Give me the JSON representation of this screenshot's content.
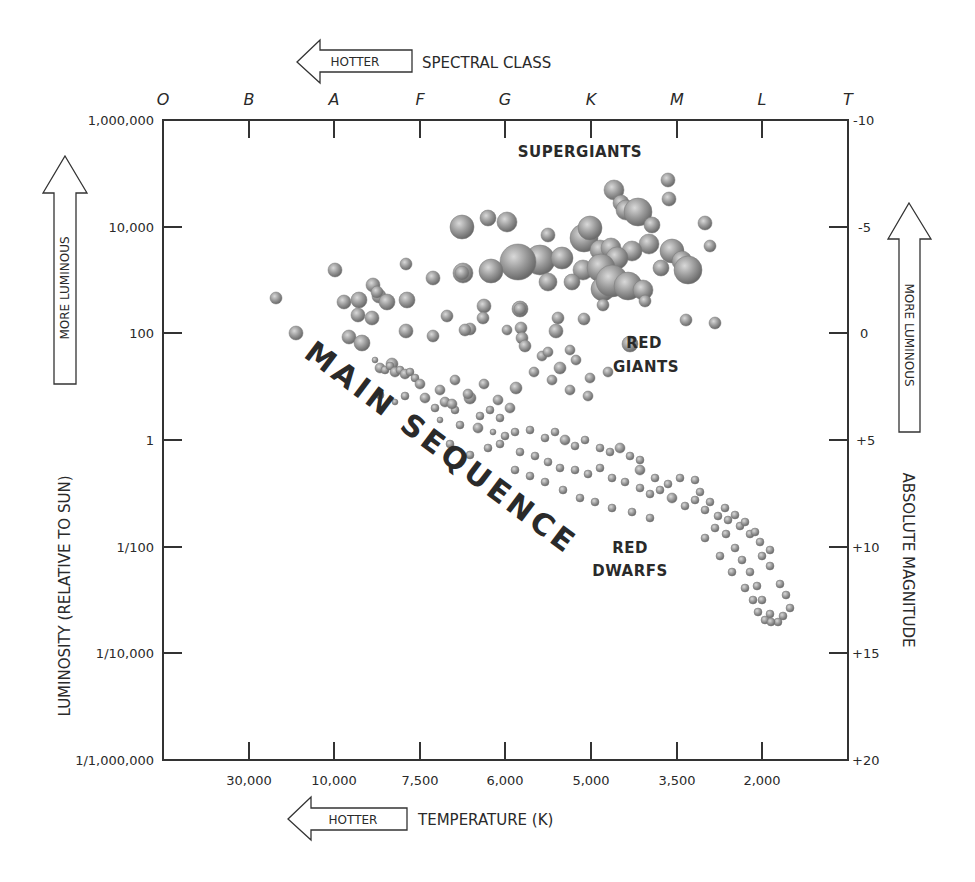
{
  "chart_data": {
    "type": "scatter",
    "top_axis": {
      "label": "SPECTRAL CLASS",
      "arrow_label": "HOTTER",
      "ticks": [
        "O",
        "B",
        "A",
        "F",
        "G",
        "K",
        "M",
        "L",
        "T"
      ]
    },
    "bottom_axis": {
      "label": "TEMPERATURE (K)",
      "arrow_label": "HOTTER",
      "ticks": [
        "30,000",
        "10,000",
        "7,500",
        "6,000",
        "5,000",
        "3,500",
        "2,000"
      ]
    },
    "left_axis": {
      "label": "LUMINOSITY (RELATIVE TO SUN)",
      "arrow_label": "MORE LUMINOUS",
      "scale": "log",
      "ticks": [
        "1,000,000",
        "10,000",
        "100",
        "1",
        "1/100",
        "1/10,000",
        "1/1,000,000"
      ],
      "ylim": [
        1e-06,
        1000000
      ]
    },
    "right_axis": {
      "label": "ABSOLUTE MAGNITUDE",
      "arrow_label": "MORE LUMINOUS",
      "ticks": [
        "-10",
        "-5",
        "0",
        "+5",
        "+10",
        "+15",
        "+20"
      ],
      "ylim": [
        -10,
        20
      ]
    },
    "annotations": [
      "SUPERGIANTS",
      "RED GIANTS",
      "MAIN SEQUENCE",
      "RED DWARFS"
    ],
    "grid": false,
    "legend": null,
    "series": [
      {
        "name": "Supergiants",
        "points_px": [
          [
            462,
            227,
            12
          ],
          [
            488,
            218,
            8
          ],
          [
            507,
            222,
            10
          ],
          [
            540,
            260,
            15
          ],
          [
            518,
            262,
            18
          ],
          [
            562,
            258,
            11
          ],
          [
            584,
            238,
            14
          ],
          [
            590,
            228,
            12
          ],
          [
            600,
            250,
            10
          ],
          [
            614,
            190,
            10
          ],
          [
            621,
            203,
            8
          ],
          [
            626,
            210,
            10
          ],
          [
            638,
            212,
            14
          ],
          [
            652,
            225,
            8
          ],
          [
            649,
            244,
            10
          ],
          [
            632,
            251,
            10
          ],
          [
            611,
            248,
            10
          ],
          [
            583,
            270,
            10
          ],
          [
            572,
            282,
            8
          ],
          [
            617,
            258,
            11
          ],
          [
            601,
            268,
            14
          ],
          [
            603,
            289,
            12
          ],
          [
            612,
            281,
            16
          ],
          [
            628,
            286,
            14
          ],
          [
            643,
            290,
            10
          ],
          [
            672,
            251,
            12
          ],
          [
            682,
            261,
            10
          ],
          [
            661,
            268,
            8
          ],
          [
            688,
            270,
            14
          ],
          [
            669,
            199,
            7
          ],
          [
            705,
            223,
            7
          ],
          [
            710,
            246,
            6
          ],
          [
            463,
            273,
            10
          ],
          [
            491,
            271,
            12
          ],
          [
            630,
            344,
            8
          ],
          [
            668,
            180,
            7
          ],
          [
            548,
            235,
            7
          ],
          [
            548,
            282,
            9
          ],
          [
            484,
            306,
            7
          ],
          [
            520,
            309,
            8
          ]
        ]
      },
      {
        "name": "Giants / bright stars",
        "points_px": [
          [
            276,
            298,
            6
          ],
          [
            296,
            333,
            7
          ],
          [
            344,
            302,
            7
          ],
          [
            373,
            285,
            7
          ],
          [
            379,
            296,
            7
          ],
          [
            359,
            300,
            8
          ],
          [
            358,
            315,
            7
          ],
          [
            349,
            337,
            7
          ],
          [
            372,
            318,
            7
          ],
          [
            377,
            292,
            6
          ],
          [
            387,
            302,
            8
          ],
          [
            407,
            300,
            8
          ],
          [
            406,
            331,
            7
          ],
          [
            362,
            343,
            8
          ],
          [
            392,
            364,
            6
          ],
          [
            335,
            270,
            7
          ],
          [
            406,
            264,
            6
          ],
          [
            433,
            278,
            7
          ],
          [
            462,
            273,
            7
          ],
          [
            470,
            329,
            6
          ],
          [
            483,
            318,
            6
          ],
          [
            520,
            309,
            6
          ],
          [
            521,
            328,
            6
          ],
          [
            522,
            338,
            6
          ],
          [
            558,
            318,
            6
          ],
          [
            556,
            331,
            7
          ],
          [
            584,
            319,
            6
          ],
          [
            603,
            305,
            6
          ],
          [
            645,
            301,
            6
          ],
          [
            686,
            320,
            6
          ],
          [
            715,
            323,
            6
          ],
          [
            447,
            316,
            6
          ],
          [
            465,
            330,
            6
          ],
          [
            433,
            336,
            6
          ]
        ]
      },
      {
        "name": "Main sequence",
        "points_px": [
          [
            375,
            360,
            3
          ],
          [
            380,
            368,
            5
          ],
          [
            385,
            370,
            4
          ],
          [
            390,
            366,
            4
          ],
          [
            395,
            372,
            5
          ],
          [
            400,
            370,
            4
          ],
          [
            405,
            374,
            5
          ],
          [
            410,
            372,
            4
          ],
          [
            415,
            378,
            4
          ],
          [
            420,
            384,
            5
          ],
          [
            380,
            395,
            4
          ],
          [
            395,
            402,
            3
          ],
          [
            405,
            396,
            4
          ],
          [
            425,
            398,
            5
          ],
          [
            435,
            408,
            4
          ],
          [
            445,
            402,
            5
          ],
          [
            455,
            410,
            4
          ],
          [
            470,
            398,
            6
          ],
          [
            480,
            416,
            4
          ],
          [
            490,
            410,
            4
          ],
          [
            500,
            418,
            4
          ],
          [
            510,
            408,
            5
          ],
          [
            460,
            425,
            4
          ],
          [
            478,
            428,
            5
          ],
          [
            493,
            432,
            3
          ],
          [
            505,
            436,
            4
          ],
          [
            515,
            432,
            4
          ],
          [
            530,
            430,
            4
          ],
          [
            545,
            438,
            4
          ],
          [
            555,
            432,
            4
          ],
          [
            565,
            440,
            5
          ],
          [
            575,
            446,
            4
          ],
          [
            585,
            440,
            4
          ],
          [
            600,
            448,
            4
          ],
          [
            610,
            452,
            4
          ],
          [
            620,
            448,
            5
          ],
          [
            630,
            456,
            4
          ],
          [
            640,
            460,
            4
          ],
          [
            500,
            444,
            4
          ],
          [
            520,
            452,
            4
          ],
          [
            535,
            456,
            4
          ],
          [
            548,
            462,
            4
          ],
          [
            560,
            468,
            4
          ],
          [
            575,
            470,
            4
          ],
          [
            588,
            474,
            4
          ],
          [
            600,
            468,
            4
          ],
          [
            612,
            478,
            4
          ],
          [
            625,
            482,
            4
          ],
          [
            640,
            488,
            4
          ],
          [
            650,
            494,
            4
          ],
          [
            660,
            490,
            4
          ],
          [
            672,
            498,
            5
          ],
          [
            685,
            506,
            4
          ],
          [
            695,
            500,
            4
          ],
          [
            705,
            510,
            4
          ],
          [
            718,
            516,
            4
          ],
          [
            728,
            520,
            4
          ],
          [
            740,
            526,
            4
          ],
          [
            750,
            534,
            4
          ],
          [
            760,
            542,
            4
          ],
          [
            770,
            550,
            4
          ],
          [
            640,
            470,
            5
          ],
          [
            655,
            478,
            4
          ],
          [
            668,
            484,
            4
          ],
          [
            680,
            478,
            4
          ],
          [
            695,
            480,
            4
          ],
          [
            700,
            492,
            4
          ],
          [
            710,
            502,
            4
          ],
          [
            725,
            508,
            4
          ],
          [
            735,
            515,
            4
          ],
          [
            745,
            522,
            4
          ],
          [
            755,
            532,
            4
          ],
          [
            762,
            556,
            4
          ],
          [
            770,
            566,
            4
          ],
          [
            780,
            584,
            4
          ],
          [
            786,
            595,
            4
          ],
          [
            790,
            608,
            4
          ],
          [
            783,
            616,
            4
          ],
          [
            778,
            622,
            4
          ],
          [
            770,
            614,
            4
          ],
          [
            762,
            600,
            4
          ],
          [
            757,
            586,
            4
          ],
          [
            750,
            572,
            4
          ],
          [
            742,
            560,
            4
          ],
          [
            735,
            548,
            4
          ],
          [
            726,
            534,
            4
          ],
          [
            715,
            528,
            4
          ],
          [
            705,
            538,
            4
          ],
          [
            720,
            556,
            4
          ],
          [
            732,
            572,
            4
          ],
          [
            745,
            588,
            4
          ],
          [
            753,
            600,
            4
          ],
          [
            758,
            612,
            4
          ],
          [
            765,
            620,
            4
          ],
          [
            771,
            622,
            4
          ],
          [
            450,
            444,
            4
          ],
          [
            470,
            455,
            4
          ],
          [
            488,
            448,
            4
          ],
          [
            440,
            420,
            3
          ],
          [
            515,
            470,
            4
          ],
          [
            530,
            476,
            4
          ],
          [
            545,
            482,
            4
          ],
          [
            563,
            490,
            4
          ],
          [
            580,
            498,
            4
          ],
          [
            595,
            502,
            4
          ],
          [
            612,
            508,
            4
          ],
          [
            632,
            512,
            4
          ],
          [
            650,
            518,
            4
          ]
        ]
      },
      {
        "name": "Red giants region",
        "points_px": [
          [
            507,
            330,
            5
          ],
          [
            525,
            346,
            6
          ],
          [
            542,
            356,
            5
          ],
          [
            560,
            368,
            6
          ],
          [
            576,
            360,
            5
          ],
          [
            590,
            378,
            5
          ],
          [
            608,
            372,
            5
          ],
          [
            534,
            372,
            5
          ],
          [
            552,
            380,
            5
          ],
          [
            570,
            390,
            5
          ],
          [
            588,
            396,
            5
          ],
          [
            516,
            388,
            6
          ],
          [
            498,
            400,
            5
          ],
          [
            484,
            384,
            5
          ],
          [
            468,
            394,
            5
          ],
          [
            452,
            404,
            5
          ],
          [
            440,
            390,
            5
          ],
          [
            455,
            380,
            5
          ],
          [
            570,
            350,
            5
          ],
          [
            548,
            352,
            5
          ]
        ]
      }
    ]
  },
  "top_header": {
    "arrow_label": "HOTTER",
    "axis_title": "SPECTRAL CLASS",
    "classes": [
      "O",
      "B",
      "A",
      "F",
      "G",
      "K",
      "M",
      "L",
      "T"
    ]
  },
  "bottom_header": {
    "arrow_label": "HOTTER",
    "axis_title": "TEMPERATURE (K)",
    "temps": [
      "30,000",
      "10,000",
      "7,500",
      "6,000",
      "5,000",
      "3,500",
      "2,000"
    ]
  },
  "left_axis": {
    "title": "LUMINOSITY (RELATIVE TO SUN)",
    "arrow_label": "MORE LUMINOUS",
    "ticks": [
      "1,000,000",
      "10,000",
      "100",
      "1",
      "1/100",
      "1/10,000",
      "1/1,000,000"
    ]
  },
  "right_axis": {
    "title": "ABSOLUTE MAGNITUDE",
    "arrow_label": "MORE LUMINOUS",
    "ticks": [
      "-10",
      "-5",
      "0",
      "+5",
      "+10",
      "+15",
      "+20"
    ]
  },
  "regions": {
    "supergiants": "SUPERGIANTS",
    "red_giants_1": "RED",
    "red_giants_2": "GIANTS",
    "main_sequence": "MAIN SEQUENCE",
    "red_dwarfs_1": "RED",
    "red_dwarfs_2": "DWARFS"
  },
  "colors": {
    "ink": "#2a2a2a",
    "star_light": "#cfcfcf",
    "star_mid": "#9a9a9a",
    "star_dark": "#6e6e6e",
    "background": "#ffffff"
  }
}
